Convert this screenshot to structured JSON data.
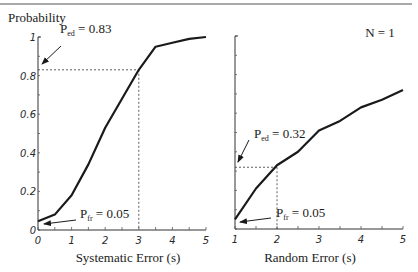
{
  "figure": {
    "y_axis_title": "Probability",
    "annotation_n": "N = 1",
    "rule_color": "#555555",
    "line_color": "#1a1a1a"
  },
  "chart_data": [
    {
      "type": "line",
      "title": "",
      "xlabel": "Systematic Error (s)",
      "ylabel": "Probability",
      "xlim": [
        0,
        5
      ],
      "ylim": [
        0,
        1
      ],
      "x_ticks": [
        "0",
        "1",
        "2",
        "3",
        "4",
        "5"
      ],
      "y_ticks": [
        "0",
        "0.2",
        "0.4",
        "0.6",
        "0.8",
        "1"
      ],
      "grid": false,
      "series": [
        {
          "name": "Detection probability vs systematic error",
          "x": [
            0,
            0.5,
            1,
            1.5,
            2,
            2.5,
            3,
            3.5,
            4,
            4.5,
            5
          ],
          "values": [
            0.045,
            0.08,
            0.18,
            0.34,
            0.53,
            0.68,
            0.83,
            0.95,
            0.97,
            0.99,
            1.0
          ]
        }
      ],
      "annotations": [
        {
          "label": "P",
          "subscript": "ed",
          "text": " = 0.83",
          "value": 0.83,
          "at_x": 3,
          "dashed_guides": true
        },
        {
          "label": "P",
          "subscript": "fr",
          "text": " = 0.05",
          "value": 0.05,
          "at_x": 0
        }
      ]
    },
    {
      "type": "line",
      "title": "",
      "xlabel": "Random Error (s)",
      "ylabel": "",
      "xlim": [
        1,
        5
      ],
      "ylim": [
        0,
        1
      ],
      "x_ticks": [
        "1",
        "2",
        "3",
        "4",
        "5"
      ],
      "y_ticks": [],
      "grid": false,
      "legend_text": "N = 1",
      "series": [
        {
          "name": "Detection probability vs random error",
          "x": [
            1,
            1.5,
            2,
            2.5,
            3,
            3.5,
            4,
            4.5,
            5
          ],
          "values": [
            0.05,
            0.21,
            0.33,
            0.4,
            0.51,
            0.56,
            0.63,
            0.67,
            0.72
          ]
        }
      ],
      "annotations": [
        {
          "label": "P",
          "subscript": "ed",
          "text": " = 0.32",
          "value": 0.32,
          "at_x": 2,
          "dashed_guides": true
        },
        {
          "label": "P",
          "subscript": "fr",
          "text": " = 0.05",
          "value": 0.05,
          "at_x": 1
        }
      ]
    }
  ]
}
